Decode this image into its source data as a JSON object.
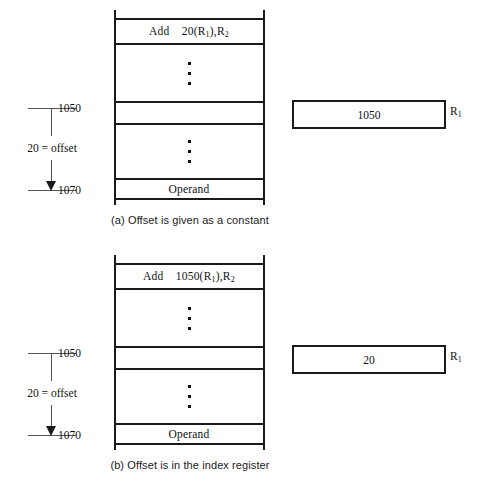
{
  "figure": {
    "panels": [
      {
        "id": "a",
        "caption": "(a) Offset is given as a constant",
        "memory": {
          "instruction": {
            "mnemonic": "Add",
            "operand_text": "20(R1),R2",
            "offset_value": "20",
            "index_register": "R",
            "index_register_sub": "1",
            "dest_register": "R",
            "dest_register_sub": "2"
          },
          "operand_cell_label": "Operand",
          "ellipsis_glyph": "vertical-ellipsis"
        },
        "offset_annotation": {
          "top_address": "1050",
          "bottom_address": "1070",
          "label": "20 = offset"
        },
        "register": {
          "value": "1050",
          "name": "R",
          "name_sub": "1"
        }
      },
      {
        "id": "b",
        "caption": "(b) Offset is in the index register",
        "memory": {
          "instruction": {
            "mnemonic": "Add",
            "operand_text": "1050(R1),R2",
            "offset_value": "1050",
            "index_register": "R",
            "index_register_sub": "1",
            "dest_register": "R",
            "dest_register_sub": "2"
          },
          "operand_cell_label": "Operand",
          "ellipsis_glyph": "vertical-ellipsis"
        },
        "offset_annotation": {
          "top_address": "1050",
          "bottom_address": "1070",
          "label": "20 = offset"
        },
        "register": {
          "value": "20",
          "name": "R",
          "name_sub": "1"
        }
      }
    ]
  },
  "colors": {
    "ink": "#1a1a1a",
    "rule": "#555555",
    "background": "#ffffff"
  }
}
